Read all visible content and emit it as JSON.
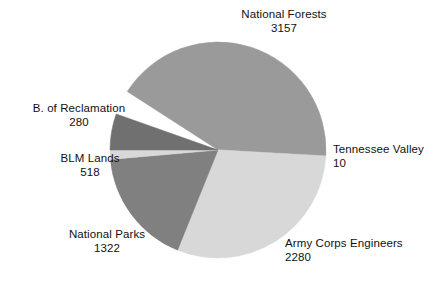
{
  "chart_data": {
    "type": "pie",
    "title": "",
    "subtitle": "",
    "xlabel": "",
    "ylabel": "",
    "legend_position": "none",
    "grid": false,
    "labels_show_value": true,
    "total": 7567,
    "units": "",
    "categories": [
      "National Forests",
      "Tennessee Valley",
      "Army Corps Engineers",
      "National Parks",
      "BLM Lands",
      "B. of Reclamation"
    ],
    "values": [
      3157,
      10,
      2280,
      1322,
      518,
      280
    ],
    "slices": [
      {
        "label": "National Forests",
        "value": 3157,
        "value_text": "3157",
        "color": "#9a9a9a",
        "start_angle": -3,
        "end_angle": 147.2
      },
      {
        "label": "Tennessee Valley",
        "value": 10,
        "value_text": "10",
        "color": "#c2c2c2",
        "start_angle": -3.5,
        "end_angle": -3
      },
      {
        "label": "Army Corps Engineers",
        "value": 2280,
        "value_text": "2280",
        "color": "#d8d8d8",
        "start_angle": -112,
        "end_angle": -3.5
      },
      {
        "label": "National Parks",
        "value": 1322,
        "value_text": "1322",
        "color": "#808080",
        "start_angle": -175,
        "end_angle": -112
      },
      {
        "label": "BLM Lands",
        "value": 518,
        "value_text": "518",
        "color": "#d8d8d8",
        "start_angle": 180,
        "end_angle": 185
      },
      {
        "label": "B. of Reclamation",
        "value": 280,
        "value_text": "280",
        "color": "#707070",
        "start_angle": 160.5,
        "end_angle": 180
      }
    ],
    "geometry": {
      "center_x": 218,
      "center_y": 150,
      "radius": 108
    },
    "background_color": "#ffffff",
    "text_color": "#111111"
  },
  "labels": {
    "national_forests": {
      "name": "National Forests",
      "value": "3157"
    },
    "tennessee_valley": {
      "name": "Tennessee Valley",
      "value": "10"
    },
    "army_corps": {
      "name": "Army Corps Engineers",
      "value": "2280"
    },
    "national_parks": {
      "name": "National Parks",
      "value": "1322"
    },
    "blm_lands": {
      "name": "BLM Lands",
      "value": "518"
    },
    "reclamation": {
      "name": "B. of Reclamation",
      "value": "280"
    }
  }
}
